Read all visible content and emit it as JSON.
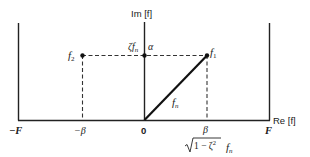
{
  "diagram": {
    "axes": {
      "imag_label": "Im [f]",
      "real_label": "Re [f]",
      "origin_label": "0"
    },
    "bounds": {
      "left_label": "−F",
      "right_label": "F"
    },
    "points": {
      "f1": {
        "label": "f",
        "sub": "1"
      },
      "f2": {
        "label": "f",
        "sub": "2"
      },
      "imag_intercept": {
        "label": "ζf",
        "sub": "n"
      },
      "alpha": {
        "label": "α"
      }
    },
    "vector_label": {
      "label": "f",
      "sub": "n"
    },
    "ticks": {
      "neg_beta": "−β",
      "beta": "β",
      "beta_formula_sqrt": "1 − ζ",
      "beta_formula_exp": "2",
      "beta_formula_tail": "f",
      "beta_formula_tail_sub": "n"
    }
  }
}
